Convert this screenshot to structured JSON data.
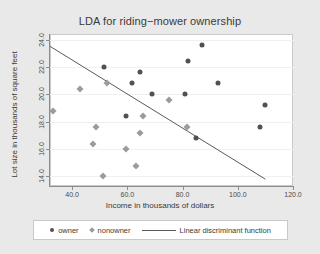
{
  "chart_data": {
    "type": "scatter",
    "title": "LDA for riding−mower ownership",
    "xlabel": "Income in thousands of dollars",
    "ylabel": "Lot size in thousands of square feet",
    "xlim": [
      32.0,
      120.0
    ],
    "ylim": [
      13.3,
      24.4
    ],
    "xticks": [
      "40.0",
      "60.0",
      "80.0",
      "100.0",
      "120.0"
    ],
    "xtick_values": [
      40.0,
      60.0,
      80.0,
      100.0,
      120.0
    ],
    "yticks": [
      "14.0",
      "16.0",
      "18.0",
      "20.0",
      "22.0",
      "24.0"
    ],
    "ytick_values": [
      14.0,
      16.0,
      18.0,
      20.0,
      22.0,
      24.0
    ],
    "grid": "horizontal",
    "legend_position": "bottom",
    "series": [
      {
        "name": "owner",
        "marker": "filled-circle",
        "color": "#50505a",
        "points": [
          {
            "x": 51.5,
            "y": 22.0
          },
          {
            "x": 59.5,
            "y": 18.4
          },
          {
            "x": 61.5,
            "y": 20.8
          },
          {
            "x": 64.5,
            "y": 21.6
          },
          {
            "x": 69.0,
            "y": 20.0
          },
          {
            "x": 81.0,
            "y": 20.0
          },
          {
            "x": 82.0,
            "y": 22.4
          },
          {
            "x": 85.0,
            "y": 16.8
          },
          {
            "x": 87.0,
            "y": 23.6
          },
          {
            "x": 93.0,
            "y": 20.8
          },
          {
            "x": 108.0,
            "y": 17.6
          },
          {
            "x": 110.0,
            "y": 19.2
          }
        ]
      },
      {
        "name": "nonowner",
        "marker": "diamond",
        "color": "#9a9aa2",
        "points": [
          {
            "x": 33.0,
            "y": 18.8
          },
          {
            "x": 43.0,
            "y": 20.4
          },
          {
            "x": 47.5,
            "y": 16.4
          },
          {
            "x": 48.5,
            "y": 17.6
          },
          {
            "x": 51.0,
            "y": 14.0
          },
          {
            "x": 52.5,
            "y": 20.8
          },
          {
            "x": 59.5,
            "y": 16.0
          },
          {
            "x": 63.0,
            "y": 14.8
          },
          {
            "x": 64.5,
            "y": 17.2
          },
          {
            "x": 65.5,
            "y": 18.4
          },
          {
            "x": 75.0,
            "y": 19.6
          },
          {
            "x": 81.5,
            "y": 17.6
          }
        ]
      }
    ],
    "line": {
      "name": "Linear discriminant function",
      "color": "#5a5a5a",
      "x0": 32.0,
      "y0": 23.5,
      "x1": 110.0,
      "y1": 13.8
    }
  },
  "legend": {
    "owner_label": "owner",
    "nonowner_label": "nonowner",
    "line_label": "Linear discriminant function"
  }
}
